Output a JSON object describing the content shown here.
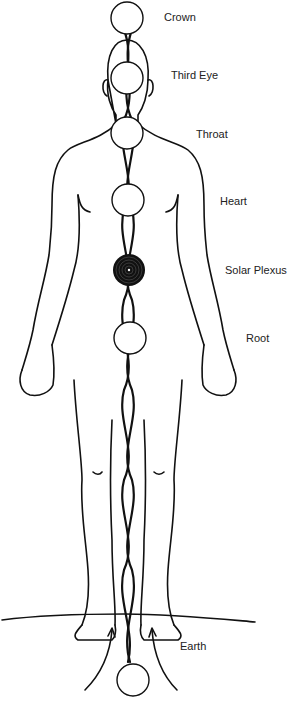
{
  "diagram": {
    "type": "chakra-body-diagram",
    "colors": {
      "line": "#111111",
      "background": "#ffffff",
      "circle_fill": "#ffffff",
      "active_fill": "#111111"
    },
    "chakras": [
      {
        "name": "Crown",
        "cx": 127,
        "cy": 18,
        "label_x": 164,
        "label_y": 11,
        "active": false
      },
      {
        "name": "Third Eye",
        "cx": 127,
        "cy": 78,
        "label_x": 171,
        "label_y": 69,
        "active": false
      },
      {
        "name": "Throat",
        "cx": 127,
        "cy": 133,
        "label_x": 196,
        "label_y": 128,
        "active": false
      },
      {
        "name": "Heart",
        "cx": 128,
        "cy": 200,
        "label_x": 220,
        "label_y": 195,
        "active": false
      },
      {
        "name": "Solar Plexus",
        "cx": 129,
        "cy": 270,
        "label_x": 225,
        "label_y": 264,
        "active": true
      },
      {
        "name": "Root",
        "cx": 130,
        "cy": 338,
        "label_x": 246,
        "label_y": 332,
        "active": false
      },
      {
        "name": "Earth",
        "cx": 133,
        "cy": 680,
        "label_x": 180,
        "label_y": 640,
        "active": false
      }
    ]
  }
}
